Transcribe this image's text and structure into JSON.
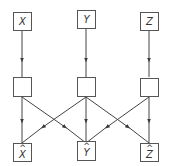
{
  "diagram": {
    "type": "network",
    "colors": {
      "stroke": "#444444",
      "box_fill": "#ffffff",
      "text": "#333333"
    },
    "inputs": [
      {
        "id": "x",
        "label": "X"
      },
      {
        "id": "y",
        "label": "Y"
      },
      {
        "id": "z",
        "label": "Z"
      }
    ],
    "hidden": [
      {
        "id": "h1",
        "label": ""
      },
      {
        "id": "h2",
        "label": ""
      },
      {
        "id": "h3",
        "label": ""
      }
    ],
    "outputs": [
      {
        "id": "xhat",
        "label": "X",
        "accent": "^"
      },
      {
        "id": "yhat",
        "label": "Y",
        "accent": "^"
      },
      {
        "id": "zhat",
        "label": "Z",
        "accent": "^"
      }
    ],
    "edges": [
      {
        "from": "x",
        "to": "h1"
      },
      {
        "from": "y",
        "to": "h2"
      },
      {
        "from": "z",
        "to": "h3"
      },
      {
        "from": "h1",
        "to": "xhat"
      },
      {
        "from": "h1",
        "to": "yhat"
      },
      {
        "from": "h2",
        "to": "xhat"
      },
      {
        "from": "h2",
        "to": "yhat"
      },
      {
        "from": "h2",
        "to": "zhat"
      },
      {
        "from": "h3",
        "to": "yhat"
      },
      {
        "from": "h3",
        "to": "zhat"
      }
    ]
  }
}
